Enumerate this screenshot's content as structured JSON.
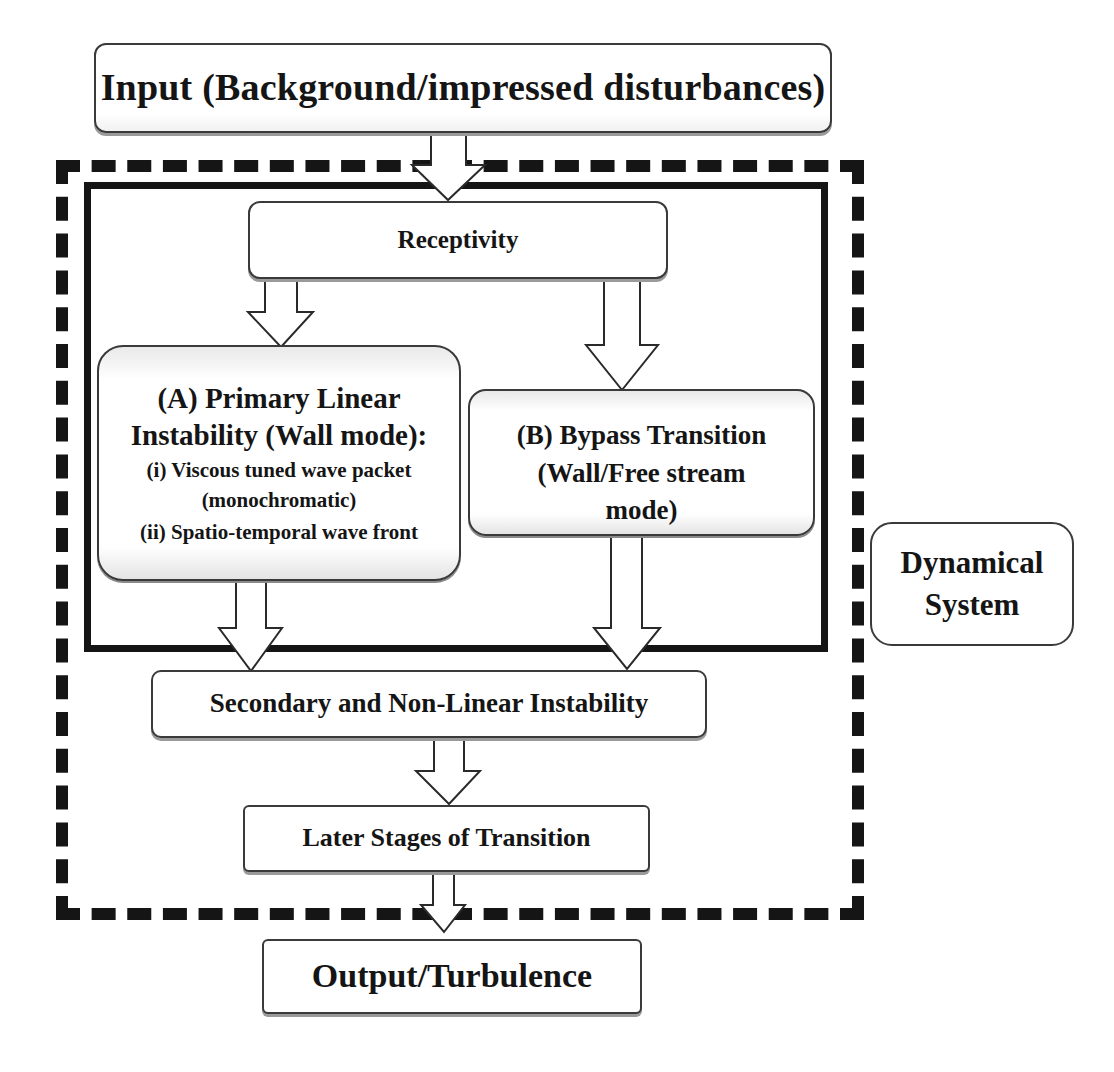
{
  "diagram": {
    "input_box": {
      "label": "Input (Background/impressed disturbances)"
    },
    "receptivity_box": {
      "label": "Receptivity"
    },
    "primary_box": {
      "title_line1": "(A) Primary Linear",
      "title_line2": "Instability  (Wall mode):",
      "item1_line1": "(i) Viscous tuned wave packet",
      "item1_line2": "(monochromatic)",
      "item2": "(ii) Spatio-temporal wave front"
    },
    "bypass_box": {
      "line1": "(B) Bypass Transition",
      "line2": "(Wall/Free stream",
      "line3": "mode)"
    },
    "secondary_box": {
      "label": "Secondary and Non-Linear Instability"
    },
    "later_box": {
      "label": "Later Stages of Transition"
    },
    "output_box": {
      "label": "Output/Turbulence"
    },
    "dynamical_system_box": {
      "line1": "Dynamical",
      "line2": "System"
    }
  },
  "colors": {
    "line": "#151515",
    "box_border": "#3a3a3a",
    "shadow": "#9a9a9a",
    "background": "#ffffff"
  }
}
